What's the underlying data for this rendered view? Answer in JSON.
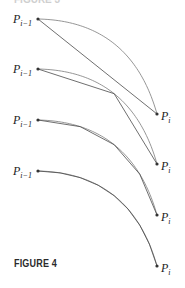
{
  "caption": "FIGURE 4",
  "top_cropped_text": "FIGURE 3",
  "colors": {
    "curve": "#8a8a8a",
    "polygon": "#4a4a4a",
    "point": "#333333",
    "text": "#222222"
  },
  "panels": [
    {
      "start_label": "P",
      "start_sub": "i−1",
      "end_label": "P",
      "end_sub": "i",
      "segments": 1,
      "start": [
        38,
        19
      ],
      "end": [
        157,
        114
      ]
    },
    {
      "start_label": "P",
      "start_sub": "i−1",
      "end_label": "P",
      "end_sub": "i",
      "segments": 2,
      "start": [
        38,
        69
      ],
      "end": [
        157,
        164
      ]
    },
    {
      "start_label": "P",
      "start_sub": "i−1",
      "end_label": "P",
      "end_sub": "i",
      "segments": 4,
      "start": [
        38,
        120
      ],
      "end": [
        157,
        215
      ]
    },
    {
      "start_label": "P",
      "start_sub": "i−1",
      "end_label": "P",
      "end_sub": "i",
      "segments": 8,
      "start": [
        38,
        171
      ],
      "end": [
        157,
        266
      ]
    }
  ]
}
